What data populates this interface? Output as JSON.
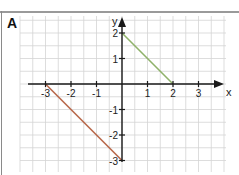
{
  "panel_label": "A",
  "chart_data": {
    "type": "line",
    "title": "",
    "xlabel": "x",
    "ylabel": "y",
    "xlim": [
      -4,
      4
    ],
    "ylim": [
      -3.3,
      2.6
    ],
    "grid": true,
    "grid_minor_step": 0.5,
    "x_ticks": [
      -3,
      -2,
      -1,
      1,
      2,
      3
    ],
    "x_tick_labels": [
      "-3",
      "-2",
      "-1",
      "1",
      "2",
      "3"
    ],
    "y_ticks": [
      -3,
      -2,
      -1,
      1,
      2
    ],
    "y_tick_labels": [
      "-3",
      "-2",
      "-1",
      "1",
      "2"
    ],
    "series": [
      {
        "name": "green-line",
        "color": "#8fb26a",
        "points": [
          [
            0,
            2
          ],
          [
            2,
            0
          ]
        ]
      },
      {
        "name": "red-line",
        "color": "#b8674a",
        "points": [
          [
            -3,
            0
          ],
          [
            0,
            -3
          ]
        ]
      }
    ]
  }
}
